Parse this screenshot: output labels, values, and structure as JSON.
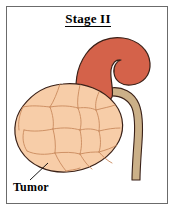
{
  "figure": {
    "title": "Stage II",
    "frame_color": "#6b6b6b",
    "background_color": "#ffffff"
  },
  "labels": {
    "tumor": "Tumor"
  },
  "anatomy": {
    "adrenal_gland": {
      "name": "adrenal-gland",
      "fill": "#D4624A",
      "stroke": "#3a2118"
    },
    "tumor_mass": {
      "name": "tumor-mass",
      "fill": "#F7CDA8",
      "stroke": "#3a2118",
      "lobule_stroke": "#C98A5E"
    },
    "ureter": {
      "name": "ureter",
      "fill": "#CBB088",
      "stroke": "#3a2118"
    }
  },
  "leader_line": {
    "name": "tumor-leader-line",
    "color": "#000000"
  }
}
